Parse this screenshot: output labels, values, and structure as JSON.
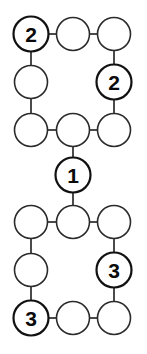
{
  "diagram": {
    "type": "node-link-graph",
    "canvas": {
      "width": 147,
      "height": 354
    },
    "style": {
      "background_color": "#ffffff",
      "node_fill_color": "#ffffff",
      "node_stroke_color": "#2b2b2b",
      "labeled_node_stroke_color": "#111111",
      "edge_color": "#2b2b2b",
      "label_color": "#0a0a0a"
    },
    "nodes": [
      {
        "id": "n1",
        "label": "2",
        "cx": 31,
        "cy": 34,
        "r": 17.5,
        "labeled": true
      },
      {
        "id": "n2",
        "label": "",
        "cx": 73,
        "cy": 34,
        "r": 16.5,
        "labeled": false
      },
      {
        "id": "n3",
        "label": "",
        "cx": 114,
        "cy": 34,
        "r": 16.5,
        "labeled": false
      },
      {
        "id": "n4",
        "label": "",
        "cx": 31,
        "cy": 82,
        "r": 16.5,
        "labeled": false
      },
      {
        "id": "n5",
        "label": "2",
        "cx": 114,
        "cy": 82,
        "r": 17.5,
        "labeled": true
      },
      {
        "id": "n6",
        "label": "",
        "cx": 31,
        "cy": 130,
        "r": 16.5,
        "labeled": false
      },
      {
        "id": "n7",
        "label": "",
        "cx": 73,
        "cy": 130,
        "r": 16.5,
        "labeled": false
      },
      {
        "id": "n8",
        "label": "",
        "cx": 114,
        "cy": 130,
        "r": 16.5,
        "labeled": false
      },
      {
        "id": "n9",
        "label": "1",
        "cx": 73,
        "cy": 175,
        "r": 17.5,
        "labeled": true
      },
      {
        "id": "n10",
        "label": "",
        "cx": 31,
        "cy": 222,
        "r": 16.5,
        "labeled": false
      },
      {
        "id": "n11",
        "label": "",
        "cx": 73,
        "cy": 222,
        "r": 16.5,
        "labeled": false
      },
      {
        "id": "n12",
        "label": "",
        "cx": 114,
        "cy": 222,
        "r": 16.5,
        "labeled": false
      },
      {
        "id": "n13",
        "label": "",
        "cx": 31,
        "cy": 270,
        "r": 16.5,
        "labeled": false
      },
      {
        "id": "n14",
        "label": "3",
        "cx": 114,
        "cy": 270,
        "r": 17.5,
        "labeled": true
      },
      {
        "id": "n15",
        "label": "3",
        "cx": 31,
        "cy": 318,
        "r": 17.5,
        "labeled": true
      },
      {
        "id": "n16",
        "label": "",
        "cx": 73,
        "cy": 318,
        "r": 16.5,
        "labeled": false
      },
      {
        "id": "n17",
        "label": "",
        "cx": 114,
        "cy": 318,
        "r": 16.5,
        "labeled": false
      }
    ],
    "edges": [
      {
        "from": "n1",
        "to": "n2",
        "x1": 49,
        "y1": 34,
        "x2": 56,
        "y2": 34
      },
      {
        "from": "n2",
        "to": "n3",
        "x1": 90,
        "y1": 34,
        "x2": 97,
        "y2": 34
      },
      {
        "from": "n1",
        "to": "n4",
        "x1": 31,
        "y1": 52,
        "x2": 31,
        "y2": 65
      },
      {
        "from": "n3",
        "to": "n5",
        "x1": 114,
        "y1": 51,
        "x2": 114,
        "y2": 64
      },
      {
        "from": "n4",
        "to": "n6",
        "x1": 31,
        "y1": 99,
        "x2": 31,
        "y2": 113
      },
      {
        "from": "n5",
        "to": "n8",
        "x1": 114,
        "y1": 100,
        "x2": 114,
        "y2": 113
      },
      {
        "from": "n6",
        "to": "n7",
        "x1": 48,
        "y1": 130,
        "x2": 56,
        "y2": 130
      },
      {
        "from": "n7",
        "to": "n8",
        "x1": 90,
        "y1": 130,
        "x2": 97,
        "y2": 130
      },
      {
        "from": "n7",
        "to": "n9",
        "x1": 73,
        "y1": 147,
        "x2": 73,
        "y2": 158
      },
      {
        "from": "n9",
        "to": "n11",
        "x1": 73,
        "y1": 193,
        "x2": 73,
        "y2": 205
      },
      {
        "from": "n10",
        "to": "n11",
        "x1": 48,
        "y1": 222,
        "x2": 56,
        "y2": 222
      },
      {
        "from": "n11",
        "to": "n12",
        "x1": 90,
        "y1": 222,
        "x2": 97,
        "y2": 222
      },
      {
        "from": "n10",
        "to": "n13",
        "x1": 31,
        "y1": 239,
        "x2": 31,
        "y2": 253
      },
      {
        "from": "n12",
        "to": "n14",
        "x1": 114,
        "y1": 239,
        "x2": 114,
        "y2": 252
      },
      {
        "from": "n13",
        "to": "n15",
        "x1": 31,
        "y1": 287,
        "x2": 31,
        "y2": 300
      },
      {
        "from": "n14",
        "to": "n17",
        "x1": 114,
        "y1": 288,
        "x2": 114,
        "y2": 301
      },
      {
        "from": "n15",
        "to": "n16",
        "x1": 49,
        "y1": 318,
        "x2": 56,
        "y2": 318
      },
      {
        "from": "n16",
        "to": "n17",
        "x1": 90,
        "y1": 318,
        "x2": 97,
        "y2": 318
      }
    ]
  }
}
